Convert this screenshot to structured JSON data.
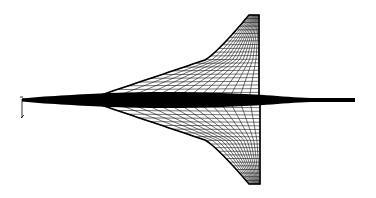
{
  "figure": {
    "title": "Delta-wing aircraft wireframe surface mesh",
    "view": "planform (top view)",
    "colors": {
      "background": "#ffffff",
      "mesh": "#000000",
      "fuselage": "#000000"
    },
    "geometry": {
      "nose": [
        355,
        100
      ],
      "tail": [
        22,
        100
      ],
      "upper_wing": {
        "root_leading": [
          95,
          97
        ],
        "kink": [
          205,
          60
        ],
        "tip_leading": [
          249,
          15
        ],
        "tip_trailing": [
          259,
          15
        ],
        "root_trailing": [
          259,
          96
        ]
      },
      "lower_wing": {
        "root_leading": [
          95,
          103
        ],
        "kink": [
          205,
          140
        ],
        "tip_leading": [
          249,
          184
        ],
        "tip_trailing": [
          260,
          184
        ],
        "root_trailing": [
          260,
          104
        ]
      },
      "spanwise_lines": 22,
      "chordwise_lines": 14
    },
    "axis_glyph": {
      "origin": [
        22,
        99
      ],
      "label": ""
    }
  }
}
